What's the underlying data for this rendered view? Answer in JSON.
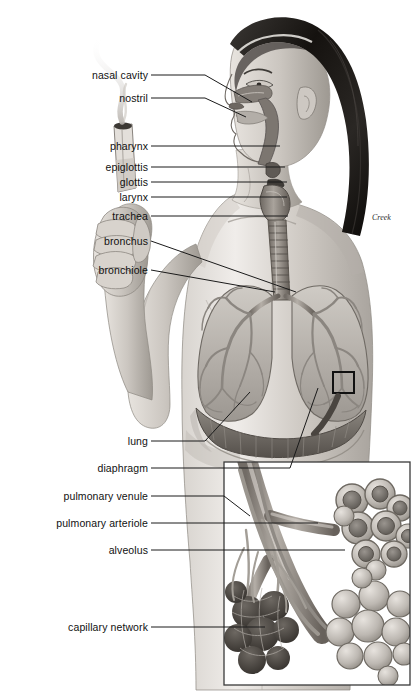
{
  "figure": {
    "signature": "Creek",
    "background_color": "#ffffff",
    "ink_color": "#111111",
    "leader_color": "#1a1a1a"
  },
  "labels": [
    {
      "id": "nasal-cavity",
      "text": "nasal cavity",
      "x": 68,
      "y": 70,
      "width": 80
    },
    {
      "id": "nostril",
      "text": "nostril",
      "x": 98,
      "y": 93,
      "width": 50
    },
    {
      "id": "pharynx",
      "text": "pharynx",
      "x": 88,
      "y": 141,
      "width": 60
    },
    {
      "id": "epiglottis",
      "text": "epiglottis",
      "x": 81,
      "y": 162,
      "width": 67
    },
    {
      "id": "glottis",
      "text": "glottis",
      "x": 97,
      "y": 177,
      "width": 51
    },
    {
      "id": "larynx",
      "text": "larynx",
      "x": 98,
      "y": 192,
      "width": 50
    },
    {
      "id": "trachea",
      "text": "trachea",
      "x": 91,
      "y": 211,
      "width": 57
    },
    {
      "id": "bronchus",
      "text": "bronchus",
      "x": 84,
      "y": 236,
      "width": 64
    },
    {
      "id": "bronchiole",
      "text": "bronchiole",
      "x": 78,
      "y": 265,
      "width": 70
    },
    {
      "id": "lung",
      "text": "lung",
      "x": 110,
      "y": 436,
      "width": 38
    },
    {
      "id": "diaphragm",
      "text": "diaphragm",
      "x": 78,
      "y": 463,
      "width": 70
    },
    {
      "id": "pulmonary-venule",
      "text": "pulmonary venule",
      "x": 50,
      "y": 491,
      "width": 98
    },
    {
      "id": "pulmonary-arteriole",
      "text": "pulmonary arteriole",
      "x": 38,
      "y": 518,
      "width": 110
    },
    {
      "id": "alveolus",
      "text": "alveolus",
      "x": 90,
      "y": 545,
      "width": 58
    },
    {
      "id": "capillary-network",
      "text": "capillary network",
      "x": 50,
      "y": 622,
      "width": 98
    }
  ],
  "leaders": [
    {
      "id": "leader-nasal-cavity",
      "points": "151,75 205,75 252,102"
    },
    {
      "id": "leader-nostril",
      "points": "151,98 205,98 246,117"
    },
    {
      "id": "leader-pharynx",
      "points": "151,146 280,146"
    },
    {
      "id": "leader-epiglottis",
      "points": "151,167 285,167"
    },
    {
      "id": "leader-glottis",
      "points": "151,182 287,182"
    },
    {
      "id": "leader-larynx",
      "points": "151,197 287,197"
    },
    {
      "id": "leader-trachea",
      "points": "151,216 288,216"
    },
    {
      "id": "leader-bronchus",
      "points": "151,241 296,292"
    },
    {
      "id": "leader-bronchiole",
      "points": "151,270 275,292"
    },
    {
      "id": "leader-lung",
      "points": "151,441 205,441 250,392"
    },
    {
      "id": "leader-diaphragm",
      "points": "151,468 290,468 318,388"
    },
    {
      "id": "leader-pulmonary-venule",
      "points": "151,496 224,496 250,516"
    },
    {
      "id": "leader-pulmonary-arteriole",
      "points": "151,523 318,523"
    },
    {
      "id": "leader-alveolus",
      "points": "151,550 345,550"
    },
    {
      "id": "leader-capillary-network",
      "points": "151,627 265,627"
    }
  ],
  "inset": {
    "id": "alveoli-detail-inset",
    "x": 224,
    "y": 462,
    "width": 186,
    "height": 223,
    "border_color": "#3a3a3a",
    "callout_box": {
      "x": 333,
      "y": 372,
      "width": 21,
      "height": 21
    },
    "arrow_note": "curved arrow from callout box down-left into inset"
  },
  "structures": [
    {
      "id": "hand-with-cigarette",
      "note": "left hand holding lit cigarette with rising smoke"
    },
    {
      "id": "head-sagittal",
      "note": "female head in profile, sagittal airway section"
    },
    {
      "id": "trachea-rings",
      "note": "ringed trachea descending into thorax"
    },
    {
      "id": "left-lung",
      "note": "lung with bronchial tree"
    },
    {
      "id": "right-lung",
      "note": "lung with bronchial tree"
    },
    {
      "id": "diaphragm-muscle",
      "note": "striated dome beneath lungs"
    },
    {
      "id": "alveolar-sac-open",
      "note": "cut-away alveolar cluster in inset"
    },
    {
      "id": "alveolar-sac-solid",
      "note": "intact alveolar cluster in inset"
    },
    {
      "id": "capillary-ball",
      "note": "dense capillary network over alveoli"
    }
  ]
}
